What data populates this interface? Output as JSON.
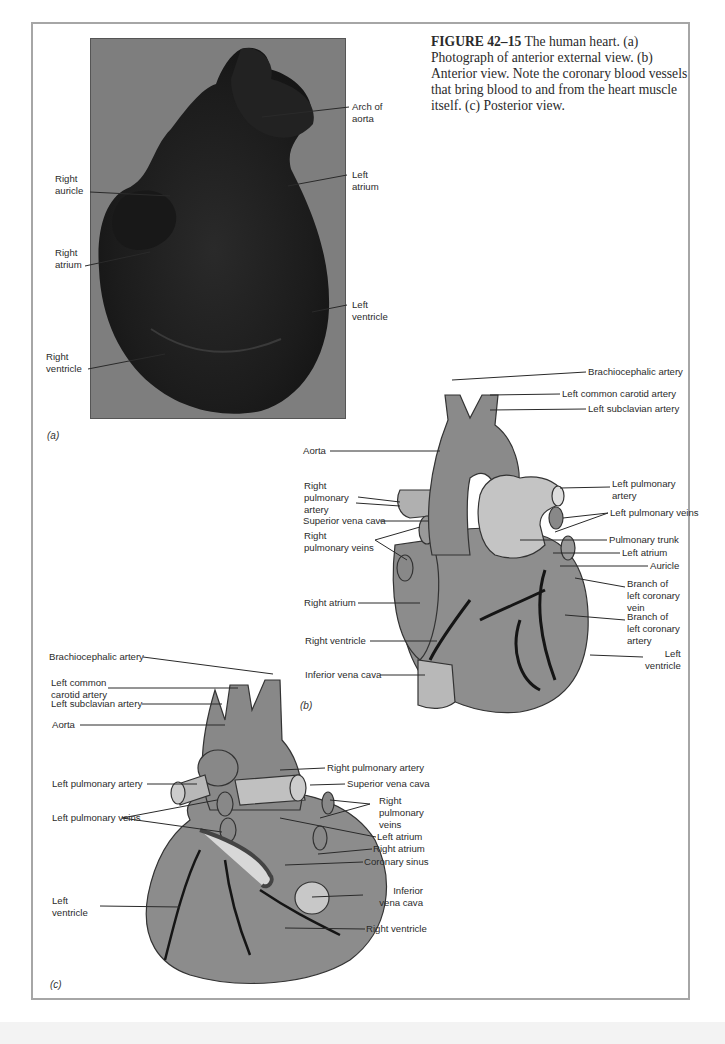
{
  "caption": {
    "figure_number": "FIGURE 42–15",
    "text": " The human heart. (a) Photograph of anterior external view. (b) Anterior view. Note the coronary blood vessels that bring blood to and from the heart muscle itself. (c) Posterior view."
  },
  "panel_a": {
    "sublabel": "(a)",
    "labels": {
      "arch_of_aorta": "Arch of\naorta",
      "left_atrium": "Left\natrium",
      "left_ventricle": "Left\nventricle",
      "right_auricle": "Right\nauricle",
      "right_atrium": "Right\natrium",
      "right_ventricle": "Right\nventricle"
    }
  },
  "panel_b": {
    "sublabel": "(b)",
    "labels": {
      "brachiocephalic_artery": "Brachiocephalic artery",
      "left_common_carotid_artery": "Left common carotid artery",
      "left_subclavian_artery": "Left subclavian artery",
      "aorta": "Aorta",
      "right_pulmonary_artery": "Right\npulmonary\nartery",
      "left_pulmonary_artery": "Left pulmonary\nartery",
      "left_pulmonary_veins": "Left pulmonary veins",
      "superior_vena_cava": "Superior vena cava",
      "right_pulmonary_veins": "Right\npulmonary veins",
      "pulmonary_trunk": "Pulmonary trunk",
      "left_atrium": "Left atrium",
      "auricle": "Auricle",
      "branch_left_coronary_vein": "Branch of\nleft coronary\nvein",
      "branch_left_coronary_artery": "Branch of\nleft coronary\nartery",
      "right_atrium": "Right atrium",
      "right_ventricle": "Right ventricle",
      "left_ventricle": "Left\nventricle",
      "inferior_vena_cava": "Inferior vena cava"
    }
  },
  "panel_c": {
    "sublabel": "(c)",
    "labels": {
      "brachiocephalic_artery": "Brachiocephalic artery",
      "left_common_carotid_artery": "Left common\ncarotid artery",
      "left_subclavian_artery": "Left subclavian artery",
      "aorta": "Aorta",
      "left_pulmonary_artery": "Left pulmonary artery",
      "left_pulmonary_veins": "Left pulmonary veins",
      "left_ventricle": "Left\nventricle",
      "right_pulmonary_artery": "Right pulmonary artery",
      "superior_vena_cava": "Superior vena cava",
      "right_pulmonary_veins": "Right\npulmonary\nveins",
      "left_atrium": "Left atrium",
      "right_atrium": "Right atrium",
      "coronary_sinus": "Coronary sinus",
      "inferior_vena_cava": "Inferior\nvena cava",
      "right_ventricle": "Right ventricle"
    }
  }
}
